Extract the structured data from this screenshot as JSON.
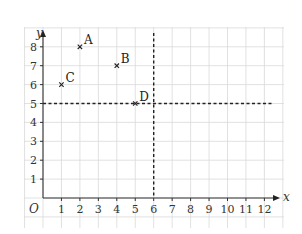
{
  "chart_data": {
    "type": "scatter",
    "title": "",
    "xlabel": "x",
    "ylabel": "y",
    "origin_label": "O",
    "xlim": [
      0,
      12
    ],
    "ylim": [
      0,
      8
    ],
    "grid": true,
    "x_ticks": [
      1,
      2,
      3,
      4,
      5,
      6,
      7,
      8,
      9,
      10,
      11,
      12
    ],
    "y_ticks": [
      1,
      2,
      3,
      4,
      5,
      6,
      7,
      8
    ],
    "points": [
      {
        "label": "A",
        "x": 2,
        "y": 8,
        "marker": "x"
      },
      {
        "label": "B",
        "x": 4,
        "y": 7,
        "marker": "x"
      },
      {
        "label": "C",
        "x": 1,
        "y": 6,
        "marker": "x"
      },
      {
        "label": "D",
        "x": 5,
        "y": 5,
        "marker": "x"
      }
    ],
    "reference_lines": [
      {
        "orientation": "vertical",
        "x": 6,
        "style": "dashed"
      },
      {
        "orientation": "horizontal",
        "y": 5,
        "style": "dashed"
      }
    ],
    "legend": null
  }
}
